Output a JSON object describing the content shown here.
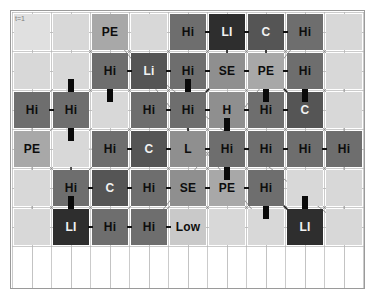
{
  "figure": {
    "type": "grid-network-diagram",
    "time_label": "t=1",
    "rows": 6,
    "cols": 9,
    "cell_size": 36,
    "gap": 3,
    "origin": {
      "x": 14,
      "y": 14
    }
  },
  "palette": {
    "background": "#ffffff",
    "panel_border": "#9a9a9a",
    "grid_line": "#b4b4b4",
    "network_line": "#8d8d8d",
    "connector_black": "#0a0a0a",
    "empty_light": "#d8d8d8",
    "empty_lighter": "#e0e0e0",
    "pale": "#c9c9c9",
    "mid": "#a8a8a8",
    "mid_dark": "#8f8f8f",
    "dark": "#6e6e6e",
    "darker": "#555555",
    "darkest": "#2e2e2e",
    "text_dark": "#0d0d0d",
    "text_light": "#f2f2f2"
  },
  "legend_values": [
    "Hi",
    "LI",
    "Li",
    "C",
    "PE",
    "SE",
    "H",
    "L",
    "Low"
  ],
  "grid": {
    "rows": [
      {
        "index": 0,
        "cells": [
          {
            "label": "",
            "shade": "empty_lighter",
            "text": "dark"
          },
          {
            "label": "",
            "shade": "empty_light",
            "text": "dark"
          },
          {
            "label": "PE",
            "shade": "mid",
            "text": "dark"
          },
          {
            "label": "",
            "shade": "empty_light",
            "text": "dark"
          },
          {
            "label": "Hi",
            "shade": "dark",
            "text": "dark"
          },
          {
            "label": "LI",
            "shade": "darkest",
            "text": "light"
          },
          {
            "label": "C",
            "shade": "darker",
            "text": "light"
          },
          {
            "label": "Hi",
            "shade": "dark",
            "text": "dark"
          },
          {
            "label": "",
            "shade": "empty_light",
            "text": "dark"
          }
        ]
      },
      {
        "index": 1,
        "cells": [
          {
            "label": "",
            "shade": "empty_light",
            "text": "dark"
          },
          {
            "label": "",
            "shade": "empty_light",
            "text": "dark"
          },
          {
            "label": "Hi",
            "shade": "dark",
            "text": "dark"
          },
          {
            "label": "Li",
            "shade": "darker",
            "text": "light"
          },
          {
            "label": "Hi",
            "shade": "dark",
            "text": "dark"
          },
          {
            "label": "SE",
            "shade": "mid_dark",
            "text": "dark"
          },
          {
            "label": "PE",
            "shade": "mid",
            "text": "dark"
          },
          {
            "label": "Hi",
            "shade": "dark",
            "text": "dark"
          },
          {
            "label": "",
            "shade": "empty_light",
            "text": "dark"
          }
        ]
      },
      {
        "index": 2,
        "cells": [
          {
            "label": "Hi",
            "shade": "dark",
            "text": "dark"
          },
          {
            "label": "Hi",
            "shade": "dark",
            "text": "dark"
          },
          {
            "label": "",
            "shade": "empty_light",
            "text": "dark"
          },
          {
            "label": "Hi",
            "shade": "dark",
            "text": "dark"
          },
          {
            "label": "Hi",
            "shade": "dark",
            "text": "dark"
          },
          {
            "label": "H",
            "shade": "mid_dark",
            "text": "dark"
          },
          {
            "label": "Hi",
            "shade": "dark",
            "text": "dark"
          },
          {
            "label": "C",
            "shade": "darker",
            "text": "light"
          },
          {
            "label": "",
            "shade": "empty_light",
            "text": "dark"
          }
        ]
      },
      {
        "index": 3,
        "cells": [
          {
            "label": "PE",
            "shade": "mid",
            "text": "dark"
          },
          {
            "label": "",
            "shade": "empty_light",
            "text": "dark"
          },
          {
            "label": "Hi",
            "shade": "dark",
            "text": "dark"
          },
          {
            "label": "C",
            "shade": "darker",
            "text": "light"
          },
          {
            "label": "L",
            "shade": "mid_dark",
            "text": "dark"
          },
          {
            "label": "Hi",
            "shade": "dark",
            "text": "dark"
          },
          {
            "label": "Hi",
            "shade": "dark",
            "text": "dark"
          },
          {
            "label": "Hi",
            "shade": "dark",
            "text": "dark"
          },
          {
            "label": "Hi",
            "shade": "dark",
            "text": "dark"
          }
        ]
      },
      {
        "index": 4,
        "cells": [
          {
            "label": "",
            "shade": "empty_light",
            "text": "dark"
          },
          {
            "label": "Hi",
            "shade": "dark",
            "text": "dark"
          },
          {
            "label": "C",
            "shade": "darker",
            "text": "light"
          },
          {
            "label": "Hi",
            "shade": "dark",
            "text": "dark"
          },
          {
            "label": "SE",
            "shade": "mid_dark",
            "text": "dark"
          },
          {
            "label": "PE",
            "shade": "mid",
            "text": "dark"
          },
          {
            "label": "Hi",
            "shade": "dark",
            "text": "dark"
          },
          {
            "label": "",
            "shade": "empty_light",
            "text": "dark"
          },
          {
            "label": "",
            "shade": "empty_light",
            "text": "dark"
          }
        ]
      },
      {
        "index": 5,
        "cells": [
          {
            "label": "",
            "shade": "empty_light",
            "text": "dark"
          },
          {
            "label": "LI",
            "shade": "darkest",
            "text": "light"
          },
          {
            "label": "Hi",
            "shade": "dark",
            "text": "dark"
          },
          {
            "label": "Hi",
            "shade": "dark",
            "text": "dark"
          },
          {
            "label": "Low",
            "shade": "pale",
            "text": "dark"
          },
          {
            "label": "",
            "shade": "empty_light",
            "text": "dark"
          },
          {
            "label": "",
            "shade": "empty_light",
            "text": "dark"
          },
          {
            "label": "LI",
            "shade": "darkest",
            "text": "light"
          },
          {
            "label": "",
            "shade": "empty_light",
            "text": "dark"
          }
        ]
      }
    ]
  },
  "connectors": {
    "vertical_bars": [
      {
        "col": 1,
        "row": 2,
        "where": "top"
      },
      {
        "col": 1,
        "row": 2,
        "where": "bottom"
      },
      {
        "col": 4,
        "row": 2,
        "where": "top"
      },
      {
        "col": 7,
        "row": 1,
        "where": "bottom"
      },
      {
        "col": 5,
        "row": 3,
        "where": "top"
      },
      {
        "col": 6,
        "row": 4,
        "where": "bottom"
      },
      {
        "col": 5,
        "row": 3,
        "where": "bottom"
      },
      {
        "col": 7,
        "row": 5,
        "where": "top"
      },
      {
        "col": 2,
        "row": 1,
        "where": "bottom"
      },
      {
        "col": 6,
        "row": 1,
        "where": "bottom"
      },
      {
        "col": 1,
        "row": 5,
        "where": "top"
      }
    ]
  }
}
